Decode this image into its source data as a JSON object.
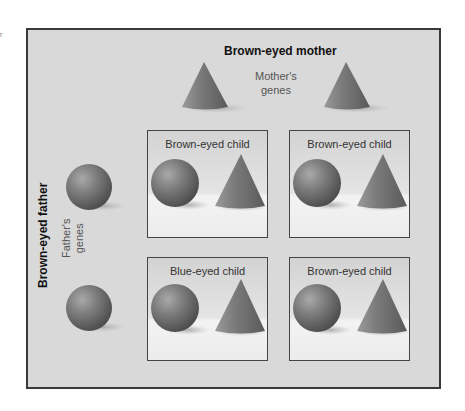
{
  "diagram": {
    "type": "punnett-square",
    "mother": {
      "title": "Brown-eyed mother",
      "genes_label_line1": "Mother's",
      "genes_label_line2": "genes",
      "genes": [
        "cone-icon",
        "cone-icon"
      ]
    },
    "father": {
      "title": "Brown-eyed father",
      "genes_label_line1": "Father's",
      "genes_label_line2": "genes",
      "genes": [
        "sphere-icon",
        "sphere-icon"
      ]
    },
    "children": [
      {
        "label": "Brown-eyed child",
        "shapes": [
          "sphere-icon",
          "cone-icon"
        ]
      },
      {
        "label": "Brown-eyed child",
        "shapes": [
          "sphere-icon",
          "cone-icon"
        ]
      },
      {
        "label": "Blue-eyed child",
        "shapes": [
          "sphere-icon",
          "cone-icon"
        ]
      },
      {
        "label": "Brown-eyed child",
        "shapes": [
          "sphere-icon",
          "cone-icon"
        ]
      }
    ],
    "colors": {
      "frame_bg": "#d9d9d9",
      "frame_border": "#3a3a3a",
      "shape_fill": "#7a7a7a"
    }
  }
}
